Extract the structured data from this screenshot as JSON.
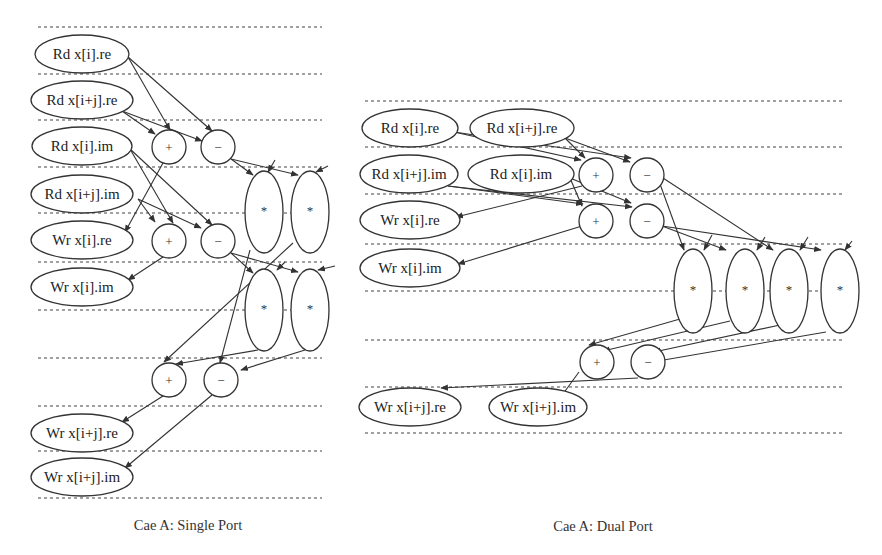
{
  "single_port": {
    "caption": "Cae A: Single Port",
    "dashed_lines": {
      "x1": 38,
      "x2": 322,
      "y": [
        27,
        74,
        120,
        167,
        213,
        262,
        310,
        358,
        406,
        451,
        498
      ]
    },
    "nodes": [
      {
        "id": "rd_i_re",
        "type": "io",
        "label": "Rd x[i].re",
        "cx": 82,
        "cy": 54,
        "rx": 47,
        "ry": 19
      },
      {
        "id": "rd_ij_re",
        "type": "io",
        "label": "Rd x[i+j].re",
        "cx": 82,
        "cy": 100,
        "rx": 51,
        "ry": 19
      },
      {
        "id": "rd_i_im",
        "type": "io",
        "label": "Rd x[i].im",
        "cx": 82,
        "cy": 146,
        "rx": 50,
        "ry": 19
      },
      {
        "id": "rd_ij_im",
        "type": "io",
        "label": "Rd x[i+j].im",
        "cx": 82,
        "cy": 194,
        "rx": 51,
        "ry": 19
      },
      {
        "id": "wr_i_re",
        "type": "io",
        "label": "Wr x[i].re",
        "cx": 82,
        "cy": 240,
        "rx": 51,
        "ry": 19
      },
      {
        "id": "wr_i_im",
        "type": "io",
        "label": "Wr x[i].im",
        "cx": 82,
        "cy": 287,
        "rx": 51,
        "ry": 19
      },
      {
        "id": "wr_ij_re",
        "type": "io",
        "label": "Wr x[i+j].re",
        "cx": 82,
        "cy": 433,
        "rx": 51,
        "ry": 19
      },
      {
        "id": "wr_ij_im",
        "type": "io",
        "label": "Wr x[i+j].im",
        "cx": 82,
        "cy": 477,
        "rx": 51,
        "ry": 19
      },
      {
        "id": "add1",
        "type": "op",
        "label": "+",
        "cx": 169,
        "cy": 147,
        "rx": 17,
        "ry": 17
      },
      {
        "id": "sub1",
        "type": "op",
        "label": "−",
        "cx": 218,
        "cy": 147,
        "rx": 17,
        "ry": 17
      },
      {
        "id": "add2",
        "type": "op",
        "label": "+",
        "cx": 169,
        "cy": 241,
        "rx": 17,
        "ry": 17
      },
      {
        "id": "sub2",
        "type": "op",
        "label": "−",
        "cx": 218,
        "cy": 241,
        "rx": 17,
        "ry": 17
      },
      {
        "id": "mul1",
        "type": "mul",
        "label": "*",
        "cx": 264,
        "cy": 212,
        "rx": 19,
        "ry": 41
      },
      {
        "id": "mul2",
        "type": "mul",
        "label": "*",
        "cx": 310,
        "cy": 212,
        "rx": 19,
        "ry": 41
      },
      {
        "id": "mul3",
        "type": "mul",
        "label": "*",
        "cx": 264,
        "cy": 310,
        "rx": 19,
        "ry": 41
      },
      {
        "id": "mul4",
        "type": "mul",
        "label": "*",
        "cx": 310,
        "cy": 310,
        "rx": 19,
        "ry": 41
      },
      {
        "id": "add3",
        "type": "op",
        "label": "+",
        "cx": 169,
        "cy": 380,
        "rx": 17,
        "ry": 17
      },
      {
        "id": "sub3",
        "type": "op",
        "label": "−",
        "cx": 221,
        "cy": 380,
        "rx": 17,
        "ry": 17
      }
    ],
    "edges": [
      [
        128,
        57,
        170,
        130
      ],
      [
        128,
        57,
        212,
        131
      ],
      [
        122,
        111,
        155,
        134
      ],
      [
        122,
        111,
        202,
        141
      ],
      [
        130,
        149,
        173,
        223
      ],
      [
        130,
        149,
        212,
        225
      ],
      [
        138,
        199,
        155,
        222
      ],
      [
        138,
        199,
        201,
        228
      ],
      [
        163,
        163,
        125,
        232
      ],
      [
        163,
        257,
        128,
        280
      ],
      [
        231,
        159,
        253,
        175
      ],
      [
        231,
        159,
        298,
        175
      ],
      [
        275,
        160,
        268,
        172
      ],
      [
        328,
        166,
        316,
        172
      ],
      [
        231,
        253,
        253,
        273
      ],
      [
        231,
        253,
        298,
        272
      ],
      [
        285,
        262,
        277,
        270
      ],
      [
        335,
        266,
        318,
        270
      ],
      [
        293,
        243,
        164,
        362
      ],
      [
        250,
        250,
        220,
        363
      ],
      [
        258,
        350,
        176,
        364
      ],
      [
        305,
        350,
        241,
        370
      ],
      [
        163,
        396,
        122,
        422
      ],
      [
        212,
        395,
        125,
        468
      ]
    ]
  },
  "dual_port": {
    "caption": "Cae A: Dual Port",
    "dashed_lines": {
      "x1": 365,
      "x2": 842,
      "y": [
        101,
        147,
        194,
        244,
        291,
        340,
        387,
        433
      ]
    },
    "nodes": [
      {
        "id": "rd_i_re",
        "type": "io",
        "label": "Rd x[i].re",
        "cx": 410,
        "cy": 128,
        "rx": 48,
        "ry": 19
      },
      {
        "id": "rd_ij_re",
        "type": "io",
        "label": "Rd x[i+j].re",
        "cx": 522,
        "cy": 128,
        "rx": 52,
        "ry": 19
      },
      {
        "id": "rd_ij_im",
        "type": "io",
        "label": "Rd x[i+j].im",
        "cx": 409,
        "cy": 174,
        "rx": 49,
        "ry": 19
      },
      {
        "id": "rd_i_im",
        "type": "io",
        "label": "Rd x[i].im",
        "cx": 521,
        "cy": 174,
        "rx": 53,
        "ry": 19
      },
      {
        "id": "wr_i_re",
        "type": "io",
        "label": "Wr x[i].re",
        "cx": 410,
        "cy": 220,
        "rx": 50,
        "ry": 19
      },
      {
        "id": "wr_i_im",
        "type": "io",
        "label": "Wr x[i].im",
        "cx": 410,
        "cy": 268,
        "rx": 50,
        "ry": 19
      },
      {
        "id": "add1",
        "type": "op",
        "label": "+",
        "cx": 596,
        "cy": 175,
        "rx": 17,
        "ry": 17
      },
      {
        "id": "sub1",
        "type": "op",
        "label": "−",
        "cx": 647,
        "cy": 175,
        "rx": 17,
        "ry": 17
      },
      {
        "id": "add2",
        "type": "op",
        "label": "+",
        "cx": 596,
        "cy": 221,
        "rx": 17,
        "ry": 17
      },
      {
        "id": "sub2",
        "type": "op",
        "label": "−",
        "cx": 647,
        "cy": 221,
        "rx": 17,
        "ry": 17
      },
      {
        "id": "mul1",
        "type": "mul",
        "label": "*",
        "cx": 693,
        "cy": 291,
        "rx": 19,
        "ry": 42
      },
      {
        "id": "mul2",
        "type": "mul",
        "label": "*",
        "cx": 745,
        "cy": 291,
        "rx": 19,
        "ry": 42
      },
      {
        "id": "mul3",
        "type": "mul",
        "label": "*",
        "cx": 789,
        "cy": 291,
        "rx": 19,
        "ry": 42
      },
      {
        "id": "mul4",
        "type": "mul",
        "label": "*",
        "cx": 840,
        "cy": 291,
        "rx": 19,
        "ry": 42
      },
      {
        "id": "add3",
        "type": "op",
        "label": "+",
        "cx": 597,
        "cy": 362,
        "rx": 17,
        "ry": 17
      },
      {
        "id": "sub3",
        "type": "op",
        "label": "−",
        "cx": 648,
        "cy": 362,
        "rx": 17,
        "ry": 17
      },
      {
        "id": "wr_ij_re",
        "type": "io",
        "label": "Wr x[i+j].re",
        "cx": 410,
        "cy": 407,
        "rx": 51,
        "ry": 19
      },
      {
        "id": "wr_ij_im",
        "type": "io",
        "label": "Wr x[i+j].im",
        "cx": 538,
        "cy": 407,
        "rx": 49,
        "ry": 19
      }
    ],
    "edges": [
      [
        454,
        132,
        581,
        160
      ],
      [
        454,
        132,
        631,
        158
      ],
      [
        565,
        138,
        585,
        158
      ],
      [
        565,
        138,
        630,
        162
      ],
      [
        448,
        186,
        583,
        204
      ],
      [
        448,
        186,
        632,
        207
      ],
      [
        570,
        178,
        582,
        206
      ],
      [
        570,
        178,
        631,
        203
      ],
      [
        582,
        186,
        456,
        217
      ],
      [
        582,
        226,
        458,
        264
      ],
      [
        660,
        184,
        684,
        250
      ],
      [
        663,
        178,
        773,
        250
      ],
      [
        662,
        226,
        726,
        250
      ],
      [
        662,
        226,
        821,
        250
      ],
      [
        712,
        235,
        704,
        250
      ],
      [
        765,
        237,
        757,
        250
      ],
      [
        808,
        237,
        800,
        250
      ],
      [
        852,
        241,
        845,
        250
      ],
      [
        680,
        319,
        589,
        345
      ],
      [
        730,
        321,
        603,
        351
      ],
      [
        780,
        325,
        654,
        352
      ],
      [
        826,
        332,
        658,
        361
      ],
      [
        638,
        378,
        441,
        388
      ],
      [
        579,
        372,
        560,
        398
      ]
    ]
  }
}
